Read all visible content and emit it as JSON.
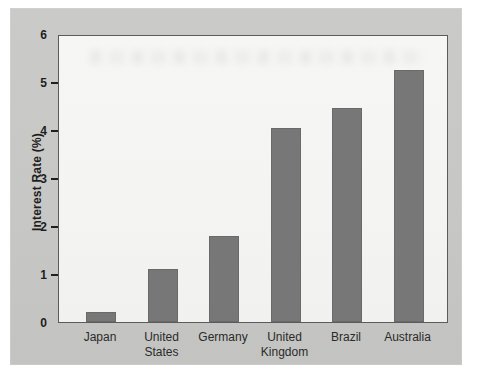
{
  "chart_data": {
    "type": "bar",
    "title": "",
    "xlabel": "",
    "ylabel": "Interest Rate (%)",
    "categories": [
      "Japan",
      "United States",
      "Germany",
      "United Kingdom",
      "Brazil",
      "Australia"
    ],
    "values": [
      0.2,
      1.1,
      1.8,
      4.05,
      4.45,
      5.25
    ],
    "ylim": [
      0,
      6
    ],
    "yticks": [
      0,
      1,
      2,
      3,
      4,
      5,
      6
    ],
    "grid": false,
    "legend": "none",
    "colors": {
      "bar": "#777777",
      "panel_bg": "#c7c8c5",
      "plot_bg": "#f4f4f2",
      "axis": "#5b5b5b",
      "tick_text": "#1e1e1e",
      "label_text": "#2a2a2a"
    }
  }
}
